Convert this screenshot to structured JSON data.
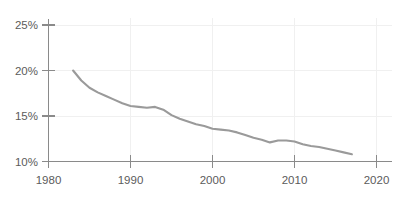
{
  "chart_data": {
    "type": "line",
    "title": "",
    "xlabel": "",
    "ylabel": "",
    "xlim": [
      1980,
      2020
    ],
    "ylim": [
      10,
      25
    ],
    "grid": true,
    "legend": null,
    "x_ticks": [
      "1980",
      "1990",
      "2000",
      "2010",
      "2020"
    ],
    "y_ticks": [
      "10%",
      "15%",
      "20%",
      "25%"
    ],
    "series": [
      {
        "name": "rate",
        "color": "#9a9a9a",
        "x": [
          1983,
          1984,
          1985,
          1986,
          1987,
          1988,
          1989,
          1990,
          1991,
          1992,
          1993,
          1994,
          1995,
          1996,
          1997,
          1998,
          1999,
          2000,
          2001,
          2002,
          2003,
          2004,
          2005,
          2006,
          2007,
          2008,
          2009,
          2010,
          2011,
          2012,
          2013,
          2014,
          2015,
          2016,
          2017
        ],
        "values": [
          20.0,
          18.9,
          18.1,
          17.6,
          17.2,
          16.8,
          16.4,
          16.1,
          16.0,
          15.9,
          16.0,
          15.7,
          15.1,
          14.7,
          14.4,
          14.1,
          13.9,
          13.6,
          13.5,
          13.4,
          13.2,
          12.9,
          12.6,
          12.4,
          12.1,
          12.3,
          12.3,
          12.2,
          11.9,
          11.7,
          11.6,
          11.4,
          11.2,
          11.0,
          10.8
        ]
      }
    ]
  },
  "axes": {
    "y_axis_name": "percent-axis",
    "x_axis_name": "year-axis"
  }
}
